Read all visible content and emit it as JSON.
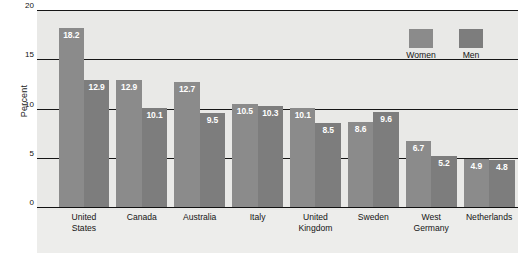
{
  "chart_data": {
    "type": "bar",
    "title": "",
    "xlabel": "",
    "ylabel": "Percent",
    "ylim": [
      0,
      20
    ],
    "yticks": [
      "0",
      "5",
      "10",
      "15",
      "20"
    ],
    "grid": true,
    "legend_position": "top-right",
    "categories": [
      "United States",
      "Canada",
      "Australia",
      "Italy",
      "United Kingdom",
      "Sweden",
      "West Germany",
      "Netherlands"
    ],
    "category_lines": [
      [
        "United",
        "States"
      ],
      [
        "Canada",
        ""
      ],
      [
        "Australia",
        ""
      ],
      [
        "Italy",
        ""
      ],
      [
        "United",
        "Kingdom"
      ],
      [
        "Sweden",
        ""
      ],
      [
        "West",
        "Germany"
      ],
      [
        "Netherlands",
        ""
      ]
    ],
    "series": [
      {
        "name": "Women",
        "color": "#8b8b8b",
        "values": [
          18.2,
          12.9,
          12.7,
          10.5,
          10.1,
          8.6,
          6.7,
          4.9
        ],
        "labels": [
          "18.2",
          "12.9",
          "12.7",
          "10.5",
          "10.1",
          "8.6",
          "6.7",
          "4.9"
        ]
      },
      {
        "name": "Men",
        "color": "#7d7d7d",
        "values": [
          12.9,
          10.1,
          9.5,
          10.3,
          8.5,
          9.6,
          5.2,
          4.8
        ],
        "labels": [
          "12.9",
          "10.1",
          "9.5",
          "10.3",
          "8.5",
          "9.6",
          "5.2",
          "4.8"
        ]
      }
    ]
  },
  "legend": {
    "items": [
      {
        "label": "Women",
        "color": "#8b8b8b"
      },
      {
        "label": "Men",
        "color": "#7d7d7d"
      }
    ]
  },
  "colors": {
    "women_bar": "#8b8b8b",
    "men_bar": "#7d7d7d",
    "plot_background": "#e9e9e7",
    "axis": "#161616",
    "value_label": "#ffffff"
  }
}
